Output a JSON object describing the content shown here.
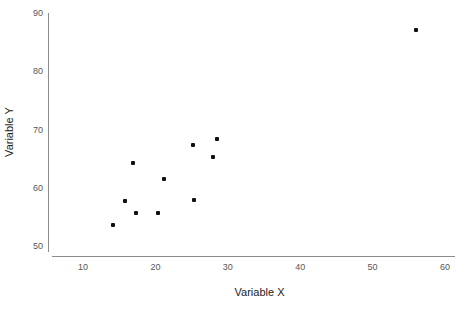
{
  "chart_data": {
    "type": "scatter",
    "title": "",
    "xlabel": "Variable X",
    "ylabel": "Variable Y",
    "xlim": [
      5,
      62
    ],
    "ylim": [
      48,
      91
    ],
    "xticks": [
      10,
      20,
      30,
      40,
      50,
      60
    ],
    "yticks": [
      50,
      60,
      70,
      80,
      90
    ],
    "xtick_labels": [
      "10",
      "20",
      "30",
      "40",
      "50",
      "60"
    ],
    "ytick_labels": [
      "50",
      "60",
      "70",
      "80",
      "90"
    ],
    "grid": false,
    "legend": null,
    "marker_color": "#111111",
    "axis_color": "#8c8c8c",
    "points": [
      {
        "x": 14.1,
        "y": 53.6
      },
      {
        "x": 15.8,
        "y": 57.7
      },
      {
        "x": 16.9,
        "y": 64.2
      },
      {
        "x": 17.3,
        "y": 55.6
      },
      {
        "x": 20.3,
        "y": 55.6
      },
      {
        "x": 21.2,
        "y": 61.5
      },
      {
        "x": 25.2,
        "y": 67.3
      },
      {
        "x": 25.4,
        "y": 57.9
      },
      {
        "x": 27.9,
        "y": 65.3
      },
      {
        "x": 28.5,
        "y": 68.4
      },
      {
        "x": 56.0,
        "y": 87.0
      }
    ]
  }
}
